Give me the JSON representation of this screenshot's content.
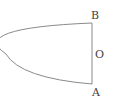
{
  "diagram": {
    "type": "geometry",
    "stroke_color": "#888888",
    "label_color": "#444444",
    "points": {
      "B": {
        "label": "B",
        "x": 92,
        "y": 23
      },
      "O": {
        "label": "O",
        "x": 92,
        "y": 54
      },
      "A": {
        "label": "A",
        "x": 92,
        "y": 84
      }
    },
    "curve": {
      "vertex": {
        "x": 6,
        "y": 54
      },
      "start": "B",
      "end": "A"
    },
    "segment": {
      "from": "B",
      "to": "A"
    }
  }
}
